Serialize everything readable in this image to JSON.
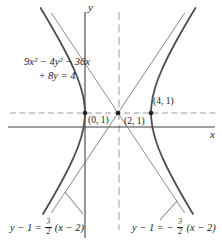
{
  "figure": {
    "equation": {
      "line1": "9x² − 4y² − 36x",
      "line2": "+ 8y = 4"
    },
    "axis_labels": {
      "x": "x",
      "y": "y"
    },
    "point_labels": {
      "left_vertex": "(0, 1)",
      "center": "(2, 1)",
      "right_vertex": "(4, 1)"
    },
    "asymptote_labels": {
      "left": {
        "prefix": "y − 1 =",
        "frac_numerator": "3",
        "frac_denominator": "2",
        "suffix": "(x − 2)"
      },
      "right": {
        "prefix": "y − 1 = −",
        "frac_numerator": "3",
        "frac_denominator": "2",
        "suffix": "(x − 2)"
      }
    },
    "colors": {
      "curve": "#4f4f4f",
      "asymptote": "#7d7d7d",
      "axis": "#3f3f3f",
      "dashed_guide": "#9c9c9c",
      "text": "#1b1b1b",
      "background": "#ffffff"
    }
  }
}
